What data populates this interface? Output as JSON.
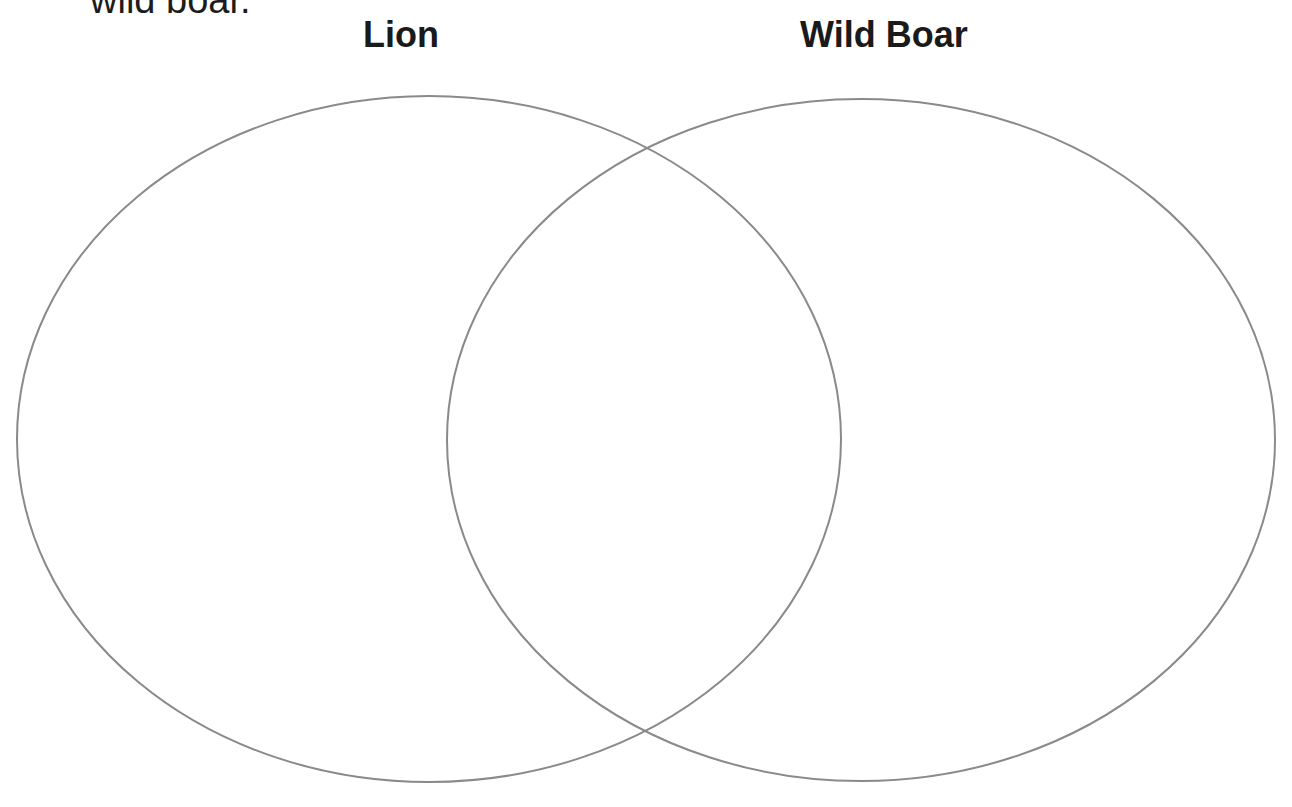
{
  "prompt": {
    "text": "wild boar."
  },
  "diagram": {
    "type": "venn",
    "sets": [
      {
        "label": "Lion",
        "cx": 429,
        "cy": 439,
        "rx": 412,
        "ry": 343
      },
      {
        "label": "Wild Boar",
        "cx": 861,
        "cy": 440,
        "rx": 414,
        "ry": 341
      }
    ],
    "regions": {
      "lion_only": [],
      "both": [],
      "wild_boar_only": []
    },
    "stroke_color": "#8a8a8a",
    "background_color": "#ffffff"
  }
}
